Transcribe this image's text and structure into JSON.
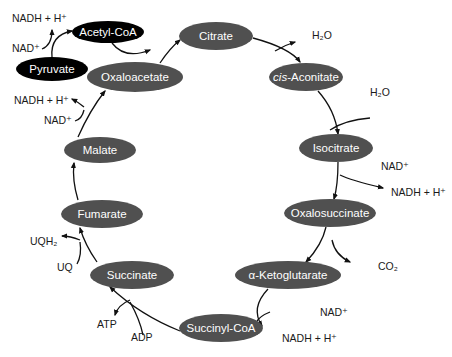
{
  "colors": {
    "cycle_node": "#505050",
    "entry_node": "#000000",
    "node_text": "#ffffff",
    "line": "#111111"
  },
  "nodes": {
    "acetyl_coa": {
      "label": "Acetyl-CoA",
      "cx": 108,
      "cy": 32,
      "rx": 36,
      "ry": 11,
      "kind": "entry"
    },
    "pyruvate": {
      "label": "Pyruvate",
      "cx": 52,
      "cy": 69,
      "rx": 36,
      "ry": 12,
      "kind": "entry"
    },
    "citrate": {
      "label": "Citrate",
      "cx": 216,
      "cy": 36,
      "rx": 37,
      "ry": 14,
      "kind": "cycle"
    },
    "cis_aconitate": {
      "prefix": "cis",
      "label": "-Aconitate",
      "cx": 306,
      "cy": 77,
      "rx": 37,
      "ry": 14,
      "kind": "cycle"
    },
    "isocitrate": {
      "label": "Isocitrate",
      "cx": 336,
      "cy": 148,
      "rx": 37,
      "ry": 14,
      "kind": "cycle"
    },
    "oxalosuccinate": {
      "label": "Oxalosuccinate",
      "cx": 330,
      "cy": 213,
      "rx": 46,
      "ry": 14,
      "kind": "cycle"
    },
    "alpha_ketoglutarate": {
      "label": "α-Ketoglutarate",
      "cx": 288,
      "cy": 275,
      "rx": 53,
      "ry": 14,
      "kind": "cycle"
    },
    "succinyl_coa": {
      "label": "Succinyl-CoA",
      "cx": 221,
      "cy": 328,
      "rx": 42,
      "ry": 14,
      "kind": "cycle"
    },
    "succinate": {
      "label": "Succinate",
      "cx": 132,
      "cy": 275,
      "rx": 42,
      "ry": 14,
      "kind": "cycle"
    },
    "fumarate": {
      "label": "Fumarate",
      "cx": 102,
      "cy": 214,
      "rx": 41,
      "ry": 14,
      "kind": "cycle"
    },
    "malate": {
      "label": "Malate",
      "cx": 100,
      "cy": 150,
      "rx": 36,
      "ry": 13,
      "kind": "cycle"
    },
    "oxaloacetate": {
      "label": "Oxaloacetate",
      "cx": 135,
      "cy": 77,
      "rx": 48,
      "ry": 15,
      "kind": "cycle"
    }
  },
  "cofactors": {
    "pyruvate_nadh": "NADH + H⁺",
    "pyruvate_nad": "NAD⁺",
    "citrate_h2o": "H₂O",
    "aconitate_h2o": "H₂O",
    "isocitrate_nad": "NAD⁺",
    "isocitrate_nadh": "NADH + H⁺",
    "oxalosuccinate_co2": "CO₂",
    "akg_nad": "NAD⁺",
    "akg_nadh": "NADH + H⁺",
    "succinyl_adp": "ADP",
    "succinyl_atp": "ATP",
    "succinate_uq": "UQ",
    "succinate_uqh2": "UQH₂",
    "malate_nad": "NAD⁺",
    "malate_nadh": "NADH + H⁺"
  }
}
